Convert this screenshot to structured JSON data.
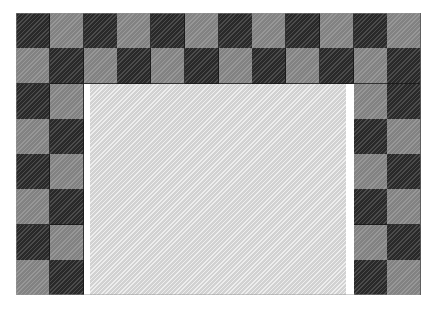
{
  "artwork": {
    "title": "Checkerboard Border Frame",
    "kind": "decorative-pattern",
    "canvas": {
      "width": 443,
      "height": 320,
      "background": "#ffffff"
    },
    "frame": {
      "x": 16,
      "y": 13,
      "width": 405,
      "height": 282,
      "columns": 12,
      "rows": 8,
      "cell_width": 33.75,
      "cell_height": 35.25,
      "full_width_rows": 2,
      "side_band_columns": 2
    },
    "colors": {
      "dark_tile": "#3b3b3b",
      "light_tile": "#8c8c8c",
      "interior_panel": "#d9d9d9",
      "grout_line": "#141414",
      "page_background": "#ffffff"
    },
    "interior": {
      "x": 90,
      "y": 84,
      "width": 256,
      "height": 211,
      "fill": "#d9d9d9",
      "texture": "fine-diagonal-hatch"
    },
    "texture": {
      "style": "diagonal-hatch",
      "angle_degrees": 135,
      "period_px": 3
    },
    "tiles": {
      "rows": [
        {
          "index": 0,
          "span": "full",
          "start_shade": "dark",
          "shades": [
            "dark",
            "light",
            "dark",
            "light",
            "dark",
            "light",
            "dark",
            "light",
            "dark",
            "light",
            "dark",
            "light"
          ]
        },
        {
          "index": 1,
          "span": "full",
          "start_shade": "light",
          "shades": [
            "light",
            "dark",
            "light",
            "dark",
            "light",
            "dark",
            "light",
            "dark",
            "light",
            "dark",
            "light",
            "dark"
          ]
        },
        {
          "index": 2,
          "span": "sides",
          "start_shade": "dark",
          "left": [
            "dark",
            "light"
          ],
          "right": [
            "light",
            "dark"
          ]
        },
        {
          "index": 3,
          "span": "sides",
          "start_shade": "light",
          "left": [
            "light",
            "dark"
          ],
          "right": [
            "dark",
            "light"
          ]
        },
        {
          "index": 4,
          "span": "sides",
          "start_shade": "dark",
          "left": [
            "dark",
            "light"
          ],
          "right": [
            "light",
            "dark"
          ]
        },
        {
          "index": 5,
          "span": "sides",
          "start_shade": "light",
          "left": [
            "light",
            "dark"
          ],
          "right": [
            "dark",
            "light"
          ]
        },
        {
          "index": 6,
          "span": "sides",
          "start_shade": "dark",
          "left": [
            "dark",
            "light"
          ],
          "right": [
            "light",
            "dark"
          ]
        },
        {
          "index": 7,
          "span": "sides",
          "start_shade": "light",
          "left": [
            "light",
            "dark"
          ],
          "right": [
            "dark",
            "light"
          ]
        }
      ]
    }
  }
}
